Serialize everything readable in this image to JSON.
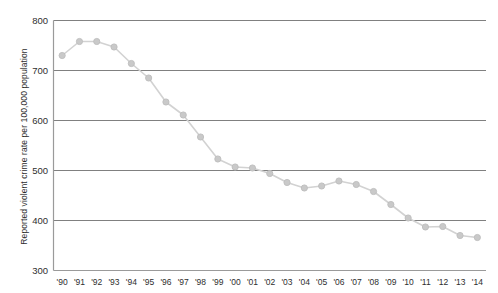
{
  "chart_data": {
    "type": "line",
    "title": "",
    "xlabel": "",
    "ylabel": "Reported violent crime rate per 100,000 population",
    "ylim": [
      300,
      800
    ],
    "y_ticks": [
      300,
      400,
      500,
      600,
      700,
      800
    ],
    "grid": "horizontal",
    "legend": "none",
    "marker": "circle",
    "line_color": "#d2d2d2",
    "marker_color": "#c9c9c9",
    "marker_edge_color": "#bdbdbd",
    "grid_color": "#808080",
    "axis_color": "#9a9a9a",
    "categories": [
      "'90",
      "'91",
      "'92",
      "'93",
      "'94",
      "'95",
      "'96",
      "'97",
      "'98",
      "'99",
      "'00",
      "'01",
      "'02",
      "'03",
      "'04",
      "'05",
      "'06",
      "'07",
      "'08",
      "'09",
      "'10",
      "'11",
      "'12",
      "'13",
      "'14"
    ],
    "values": [
      730,
      758,
      758,
      747,
      714,
      685,
      637,
      611,
      567,
      523,
      507,
      505,
      494,
      476,
      465,
      469,
      479,
      472,
      458,
      432,
      405,
      387,
      388,
      370,
      366
    ]
  }
}
